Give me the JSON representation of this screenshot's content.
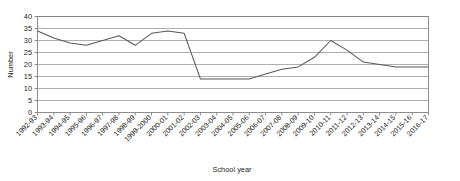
{
  "chart_data": {
    "type": "line",
    "title": "",
    "xlabel": "School year",
    "ylabel": "Number",
    "ylim": [
      0,
      40
    ],
    "ytick_step": 5,
    "yticks": [
      0,
      5,
      10,
      15,
      20,
      25,
      30,
      35,
      40
    ],
    "grid": true,
    "legend": "none",
    "line_color": "#595959",
    "grid_color": "#8c8c8c",
    "axis_color": "#808080",
    "categories": [
      "1992-93",
      "1993-94",
      "1994-95",
      "1995-96",
      "1996-97",
      "1997-98",
      "1998-99",
      "1999-2000",
      "2000-01",
      "2001-02",
      "2002-03",
      "2003-04",
      "2004-05",
      "2005-06",
      "2006-07",
      "2007-08",
      "2008-09",
      "2009-10",
      "2010-11",
      "2011-12",
      "2012-13",
      "2013-14",
      "2014-15",
      "2015-16",
      "2016-17"
    ],
    "values": [
      34,
      31,
      29,
      28,
      30,
      32,
      28,
      33,
      34,
      33,
      14,
      14,
      14,
      14,
      16,
      18,
      19,
      23,
      30,
      26,
      21,
      20,
      19,
      19,
      19
    ],
    "series": [
      {
        "name": "Number",
        "values": [
          34,
          31,
          29,
          28,
          30,
          32,
          28,
          33,
          34,
          33,
          14,
          14,
          14,
          14,
          16,
          18,
          19,
          23,
          30,
          26,
          21,
          20,
          19,
          19,
          19
        ]
      }
    ]
  }
}
